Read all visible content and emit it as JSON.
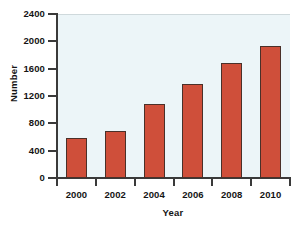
{
  "chart_data": {
    "type": "bar",
    "title": "",
    "xlabel": "Year",
    "ylabel": "Number",
    "categories": [
      "2000",
      "2002",
      "2004",
      "2006",
      "2008",
      "2010"
    ],
    "values": [
      590,
      690,
      1090,
      1380,
      1680,
      1930
    ],
    "series": [
      {
        "name": "Number",
        "values": [
          590,
          690,
          1090,
          1380,
          1680,
          1930
        ]
      }
    ],
    "ylim": [
      0,
      2400
    ],
    "yticks": [
      0,
      400,
      800,
      1200,
      1600,
      2000,
      2400
    ],
    "ytick_labels": [
      "0",
      "400",
      "800",
      "1200",
      "1600",
      "2000",
      "2400"
    ],
    "xtick_labels": [
      "2000",
      "2002",
      "2004",
      "2006",
      "2008",
      "2010"
    ],
    "grid": false,
    "legend": false,
    "legend_position": "none",
    "bar_color": "#cf4f3a",
    "bar_edge_color": "#4a3029",
    "plot_background": "#ecf5f8",
    "axis_color": "#3a3a3a",
    "text_color": "#141414"
  }
}
